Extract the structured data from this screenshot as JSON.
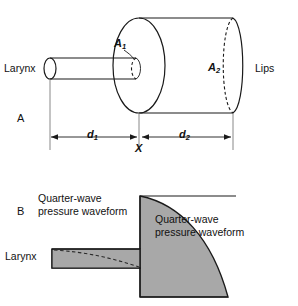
{
  "figure": {
    "width": 298,
    "height": 306,
    "background": "#ffffff",
    "ink_color": "#1a1a1a",
    "shade_color": "#a8a8a8"
  },
  "panel_a": {
    "label": "A",
    "larynx_label": "Larynx",
    "lips_label": "Lips",
    "area_near_label": "A",
    "area_near_subscript": "1",
    "area_far_label": "A",
    "area_far_subscript": "2",
    "distance_near_label": "d",
    "distance_near_subscript": "1",
    "distance_far_label": "d",
    "distance_far_subscript": "2",
    "junction_label": "X"
  },
  "panel_b": {
    "label": "B",
    "larynx_label": "Larynx",
    "waveform_left_line1": "Quarter-wave",
    "waveform_left_line2": "pressure waveform",
    "waveform_right_line1": "Quarter-wave",
    "waveform_right_line2": "pressure waveform"
  }
}
